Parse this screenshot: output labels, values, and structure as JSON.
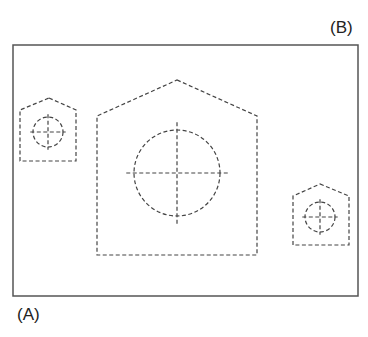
{
  "labels": {
    "top_right": "(B)",
    "bottom_left": "(A)"
  },
  "colors": {
    "frame": "#555555",
    "dashed": "#444444",
    "background": "#ffffff"
  },
  "frame": {
    "x": 13,
    "y": 45,
    "width": 345,
    "height": 251
  },
  "shapes": [
    {
      "name": "small-pentagon-left",
      "apex": [
        49,
        98
      ],
      "shoulder_y": 110,
      "left": 20,
      "right": 76,
      "bottom": 161,
      "circle": {
        "cx": 48,
        "cy": 132,
        "r": 15
      }
    },
    {
      "name": "large-pentagon-center",
      "apex": [
        177,
        80
      ],
      "shoulder_y": 116,
      "left": 97,
      "right": 257,
      "bottom": 255,
      "circle": {
        "cx": 177,
        "cy": 173,
        "r": 43
      }
    },
    {
      "name": "small-pentagon-right",
      "apex": [
        320,
        184
      ],
      "shoulder_y": 196,
      "left": 293,
      "right": 349,
      "bottom": 245,
      "circle": {
        "cx": 320,
        "cy": 217,
        "r": 15
      }
    }
  ]
}
